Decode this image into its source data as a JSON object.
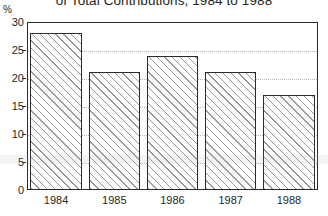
{
  "chart_data": {
    "type": "bar",
    "title": "of Total Contributions, 1984 to 1988",
    "xlabel": "",
    "ylabel": "%",
    "categories": [
      "1984",
      "1985",
      "1986",
      "1987",
      "1988"
    ],
    "values": [
      28,
      21,
      24,
      21,
      17
    ],
    "ylim": [
      0,
      30
    ],
    "yticks": [
      0,
      5,
      10,
      15,
      20,
      25,
      30
    ],
    "ytick_labels": [
      "0",
      "5",
      "10",
      "15",
      "20",
      "25",
      "30"
    ],
    "grid": true,
    "grid_axis": "y",
    "legend": null,
    "legend_position": "none",
    "bar_fill": "hatched-diagonal",
    "bar_edge_color": "#2b2b2b",
    "bar_hatch_color": "#9a9a9a",
    "background_color": "#ffffff",
    "series": [
      {
        "name": "Percent of Total Contributions",
        "values": [
          28,
          21,
          24,
          21,
          17
        ]
      }
    ]
  },
  "axis_unit_label": "%"
}
